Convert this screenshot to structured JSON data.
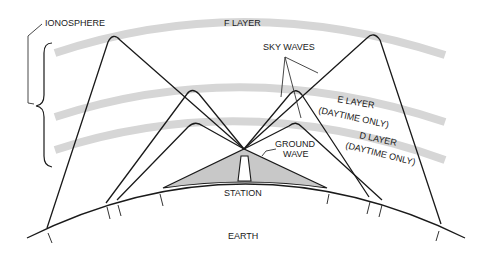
{
  "diagram": {
    "labels": {
      "ionosphere": "IONOSPHERE",
      "f_layer": "F LAYER",
      "sky_waves": "SKY WAVES",
      "e_layer": "E LAYER",
      "e_layer_note": "(DAYTIME ONLY)",
      "d_layer": "D LAYER",
      "d_layer_note": "(DAYTIME ONLY)",
      "ground_wave_1": "GROUND",
      "ground_wave_2": "WAVE",
      "station": "STATION",
      "earth": "EARTH"
    },
    "colors": {
      "layer_band": "#d6d6d6",
      "ground_wave_fill": "#c8c8c8",
      "line": "#1a1a1a"
    },
    "layers": [
      "F LAYER",
      "E LAYER (DAYTIME ONLY)",
      "D LAYER (DAYTIME ONLY)"
    ],
    "wave_types": [
      "sky waves",
      "ground wave"
    ]
  }
}
